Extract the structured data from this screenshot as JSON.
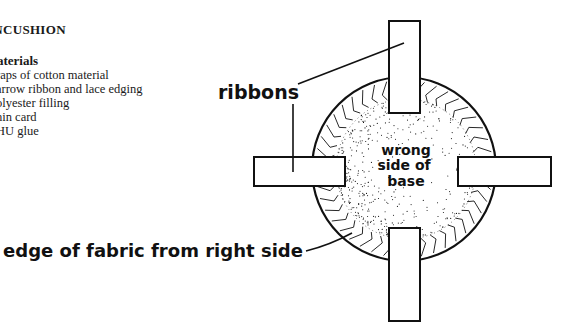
{
  "document": {
    "title": "INCUSHION",
    "materials_heading": "aterials",
    "materials": [
      "raps of cotton material",
      "arrow ribbon and lace edging",
      "olyester filling",
      "hin card",
      "HU glue"
    ]
  },
  "diagram": {
    "labels": {
      "ribbons": "ribbons",
      "center_line1": "wrong",
      "center_line2": "side of",
      "center_line3": "base",
      "edge": "edge of fabric from right side"
    },
    "parts": [
      "top-ribbon",
      "left-ribbon",
      "right-ribbon",
      "bottom-ribbon",
      "fabric-circle",
      "stippled-base"
    ],
    "colors": {
      "ink": "#111111",
      "paper": "#ffffff"
    }
  }
}
